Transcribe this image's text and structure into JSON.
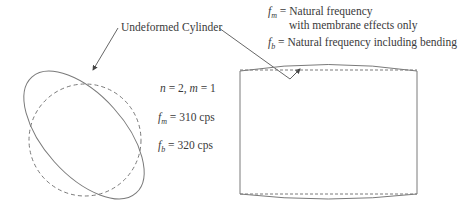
{
  "figure": {
    "callout_label": "Undeformed Cylinder",
    "mode": {
      "n_symbol": "n",
      "n_value": "2",
      "m_symbol": "m",
      "m_value": "1",
      "separator": ",",
      "equals": "="
    },
    "frequencies": [
      {
        "symbol": "f",
        "subscript": "m",
        "equals": "=",
        "value": "310 cps"
      },
      {
        "symbol": "f",
        "subscript": "b",
        "equals": "=",
        "value": "320 cps"
      }
    ],
    "legend": [
      {
        "symbol": "f",
        "subscript": "m",
        "equals": "=",
        "line1": "Natural frequency",
        "line2": "with membrane effects only"
      },
      {
        "symbol": "f",
        "subscript": "b",
        "equals": "=",
        "line1": "Natural frequency including bending"
      }
    ],
    "colors": {
      "stroke": "#7a7a7a",
      "text": "#3a3a3a",
      "background": "#ffffff"
    }
  }
}
